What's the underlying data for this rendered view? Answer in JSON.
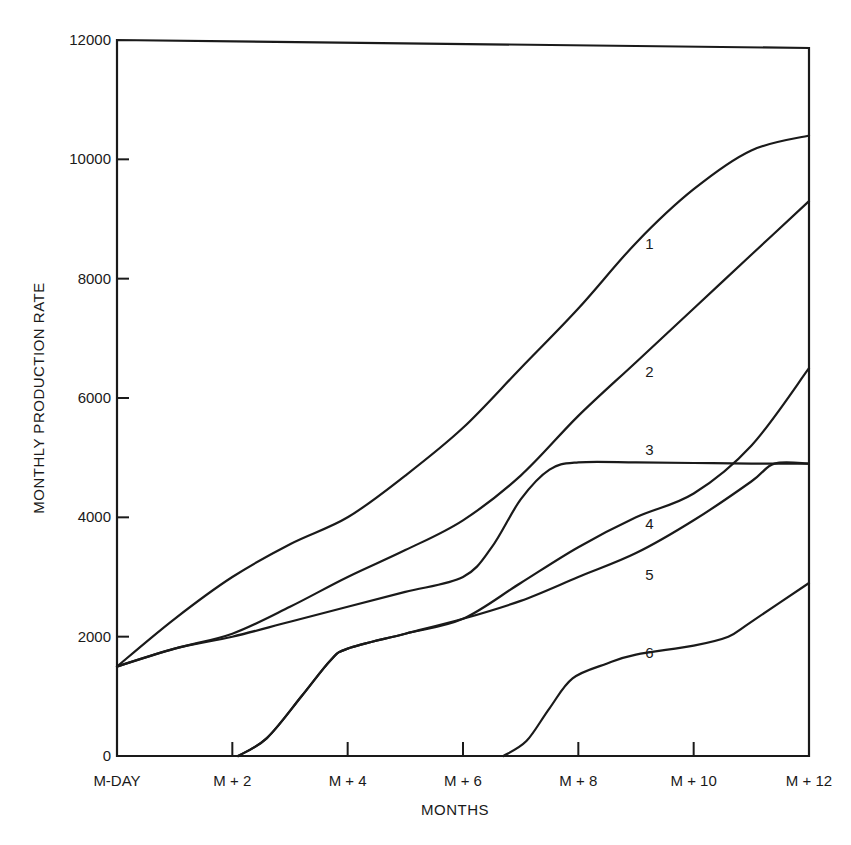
{
  "chart_data": {
    "type": "line",
    "title": "",
    "xlabel": "MONTHS",
    "ylabel": "MONTHLY PRODUCTION RATE",
    "ylim": [
      0,
      12000
    ],
    "xlim": [
      0,
      12
    ],
    "grid": false,
    "legend_position": "inline curve labels",
    "y_ticks": [
      0,
      2000,
      4000,
      6000,
      8000,
      10000,
      12000
    ],
    "y_tick_labels": [
      "0",
      "2000",
      "4000",
      "6000",
      "8000",
      "10000",
      "12000"
    ],
    "x_ticks": [
      0,
      2,
      4,
      6,
      8,
      10,
      12
    ],
    "x_tick_labels": [
      "M-DAY",
      "M + 2",
      "M + 4",
      "M + 6",
      "M + 8",
      "M + 10",
      "M + 12"
    ],
    "series": [
      {
        "name": "1",
        "label_pos": [
          9.3,
          8500
        ],
        "points": [
          [
            0,
            1500
          ],
          [
            1,
            2300
          ],
          [
            2,
            3000
          ],
          [
            3,
            3550
          ],
          [
            4,
            4000
          ],
          [
            5,
            4700
          ],
          [
            6,
            5500
          ],
          [
            7,
            6500
          ],
          [
            8,
            7500
          ],
          [
            9,
            8600
          ],
          [
            10,
            9500
          ],
          [
            11,
            10150
          ],
          [
            12,
            10400
          ]
        ]
      },
      {
        "name": "2",
        "label_pos": [
          9.3,
          6350
        ],
        "points": [
          [
            0,
            1500
          ],
          [
            1,
            1800
          ],
          [
            2,
            2050
          ],
          [
            3,
            2500
          ],
          [
            4,
            3000
          ],
          [
            5,
            3450
          ],
          [
            6,
            3950
          ],
          [
            7,
            4700
          ],
          [
            8,
            5700
          ],
          [
            9,
            6600
          ],
          [
            10,
            7500
          ],
          [
            11,
            8400
          ],
          [
            12,
            9300
          ]
        ]
      },
      {
        "name": "3",
        "label_pos": [
          9.3,
          5050
        ],
        "points": [
          [
            0,
            1500
          ],
          [
            1,
            1800
          ],
          [
            2,
            2000
          ],
          [
            3,
            2250
          ],
          [
            4,
            2500
          ],
          [
            5,
            2750
          ],
          [
            6,
            3000
          ],
          [
            6.5,
            3500
          ],
          [
            7,
            4300
          ],
          [
            7.5,
            4800
          ],
          [
            8,
            4920
          ],
          [
            9,
            4920
          ],
          [
            10,
            4910
          ],
          [
            11,
            4900
          ],
          [
            12,
            4900
          ]
        ]
      },
      {
        "name": "4",
        "label_pos": [
          9.3,
          3800
        ],
        "points": [
          [
            2.1,
            0
          ],
          [
            2.6,
            300
          ],
          [
            3.2,
            1000
          ],
          [
            3.7,
            1600
          ],
          [
            4,
            1800
          ],
          [
            5,
            2050
          ],
          [
            6,
            2300
          ],
          [
            7,
            2900
          ],
          [
            8,
            3500
          ],
          [
            9,
            4000
          ],
          [
            10,
            4400
          ],
          [
            11,
            5200
          ],
          [
            12,
            6500
          ]
        ]
      },
      {
        "name": "5",
        "label_pos": [
          9.3,
          2950
        ],
        "points": [
          [
            2.1,
            0
          ],
          [
            2.6,
            300
          ],
          [
            3.2,
            1000
          ],
          [
            3.7,
            1600
          ],
          [
            4,
            1800
          ],
          [
            5,
            2050
          ],
          [
            6,
            2300
          ],
          [
            7,
            2600
          ],
          [
            8,
            3000
          ],
          [
            9,
            3400
          ],
          [
            10,
            3950
          ],
          [
            11,
            4600
          ],
          [
            11.4,
            4900
          ],
          [
            12,
            4900
          ]
        ]
      },
      {
        "name": "6",
        "label_pos": [
          9.3,
          1650
        ],
        "points": [
          [
            6.7,
            0
          ],
          [
            7.1,
            250
          ],
          [
            7.5,
            800
          ],
          [
            7.9,
            1300
          ],
          [
            8.5,
            1550
          ],
          [
            9,
            1700
          ],
          [
            10,
            1850
          ],
          [
            10.6,
            2000
          ],
          [
            11,
            2250
          ],
          [
            12,
            2900
          ]
        ]
      }
    ]
  },
  "plot": {
    "left": 117,
    "right": 809,
    "top": 40,
    "bottom": 756
  }
}
